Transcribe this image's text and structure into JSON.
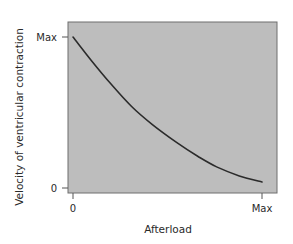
{
  "chart_data": {
    "type": "line",
    "title": "",
    "xlabel": "Afterload",
    "ylabel": "Velocity of ventricular contraction",
    "x_ticks": [
      "0",
      "Max"
    ],
    "y_ticks": [
      "0",
      "Max"
    ],
    "xlim": [
      0,
      1
    ],
    "ylim": [
      0,
      1
    ],
    "grid": false,
    "legend": null,
    "plot_background": "#bdbdbd",
    "line_color": "#2b2b2b",
    "series": [
      {
        "name": "Force-velocity relationship",
        "x": [
          0,
          0.1,
          0.2,
          0.31,
          0.42,
          0.55,
          0.66,
          0.76,
          0.88,
          1.0
        ],
        "y": [
          1.0,
          0.84,
          0.69,
          0.54,
          0.42,
          0.3,
          0.21,
          0.14,
          0.08,
          0.04
        ]
      }
    ]
  }
}
